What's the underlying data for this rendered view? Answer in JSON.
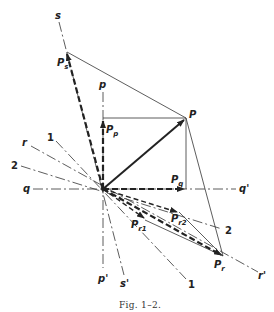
{
  "figure": {
    "caption": "Fig. 1–2.",
    "labels": {
      "s": "s",
      "s_prime": "s'",
      "p_axis": "p",
      "p_prime": "p'",
      "q": "q",
      "q_prime": "q'",
      "r": "r",
      "r_prime": "r'",
      "one_upper": "1",
      "one_lower": "1",
      "two_left": "2",
      "two_right": "2",
      "P": "P",
      "Ps_main": "P",
      "Ps_sub": "s",
      "Pp_main": "P",
      "Pp_sub": "p",
      "Pq_main": "P",
      "Pq_sub": "q",
      "Pr_main": "P",
      "Pr_sub": "r",
      "Pr1_main": "P",
      "Pr1_sub": "r1",
      "Pr2_main": "P",
      "Pr2_sub": "r2"
    },
    "colors": {
      "ink": "#222222",
      "background": "#ffffff"
    }
  }
}
